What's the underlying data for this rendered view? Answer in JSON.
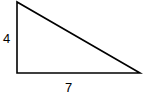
{
  "diagram": {
    "type": "right-triangle",
    "labels": {
      "vertical_side": "4",
      "horizontal_side": "7"
    },
    "stroke_color": "#000000"
  }
}
